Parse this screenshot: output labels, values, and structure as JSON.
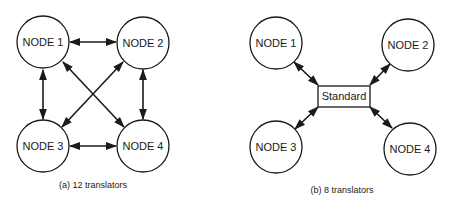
{
  "diagram_a": {
    "caption": "(a) 12 translators",
    "nodes": [
      {
        "label": "NODE 1"
      },
      {
        "label": "NODE 2"
      },
      {
        "label": "NODE 3"
      },
      {
        "label": "NODE 4"
      }
    ],
    "edges": [
      {
        "from": "NODE 1",
        "to": "NODE 2",
        "type": "bidirectional"
      },
      {
        "from": "NODE 1",
        "to": "NODE 3",
        "type": "bidirectional"
      },
      {
        "from": "NODE 1",
        "to": "NODE 4",
        "type": "bidirectional"
      },
      {
        "from": "NODE 2",
        "to": "NODE 3",
        "type": "bidirectional"
      },
      {
        "from": "NODE 2",
        "to": "NODE 4",
        "type": "bidirectional"
      },
      {
        "from": "NODE 3",
        "to": "NODE 4",
        "type": "bidirectional"
      }
    ]
  },
  "diagram_b": {
    "caption": "(b) 8 translators",
    "hub": {
      "label": "Standard"
    },
    "nodes": [
      {
        "label": "NODE 1"
      },
      {
        "label": "NODE 2"
      },
      {
        "label": "NODE 3"
      },
      {
        "label": "NODE 4"
      }
    ],
    "edges": [
      {
        "from": "NODE 1",
        "to": "Standard",
        "type": "bidirectional"
      },
      {
        "from": "NODE 2",
        "to": "Standard",
        "type": "bidirectional"
      },
      {
        "from": "NODE 3",
        "to": "Standard",
        "type": "bidirectional"
      },
      {
        "from": "NODE 4",
        "to": "Standard",
        "type": "bidirectional"
      }
    ]
  }
}
